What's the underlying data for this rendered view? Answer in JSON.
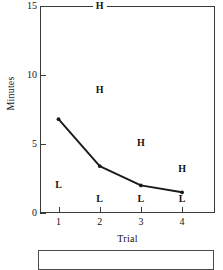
{
  "chart_data": {
    "type": "line",
    "title": "",
    "xlabel": "Trial",
    "ylabel": "Minutes",
    "x": [
      1,
      2,
      3,
      4
    ],
    "categories": [
      "1",
      "2",
      "3",
      "4"
    ],
    "xlim": [
      0.55,
      4.8
    ],
    "ylim": [
      0,
      15
    ],
    "grid": false,
    "legend": "none",
    "xticks": [
      "1",
      "2",
      "3",
      "4"
    ],
    "yticks": [
      "0",
      "5",
      "10",
      "15"
    ],
    "ytick_values": [
      0,
      5,
      10,
      15
    ],
    "series": [
      {
        "name": "Minutes",
        "values": [
          6.8,
          3.4,
          2.0,
          1.5
        ],
        "marker": "dot",
        "color": "#1a1a1a"
      }
    ],
    "annotations": [
      {
        "label": "H",
        "x": 2,
        "y": 15.0
      },
      {
        "label": "H",
        "x": 2,
        "y": 8.9
      },
      {
        "label": "H",
        "x": 3,
        "y": 5.1
      },
      {
        "label": "H",
        "x": 4,
        "y": 3.2
      },
      {
        "label": "L",
        "x": 1,
        "y": 2.0
      },
      {
        "label": "L",
        "x": 2,
        "y": 1.0
      },
      {
        "label": "L",
        "x": 3,
        "y": 1.0
      },
      {
        "label": "L",
        "x": 4,
        "y": 1.0
      }
    ]
  }
}
